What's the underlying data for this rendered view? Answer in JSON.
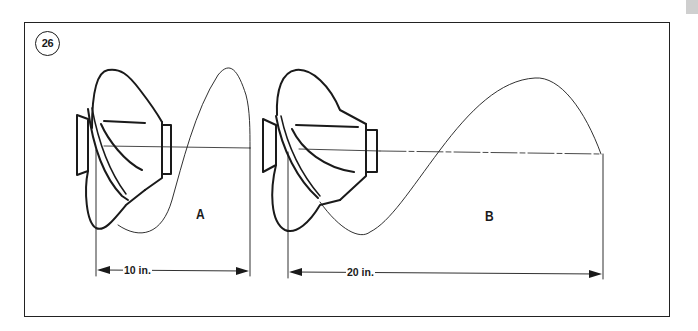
{
  "figure": {
    "number": "26",
    "border_color": "#222222",
    "line_color": "#1a1a1a"
  },
  "diagrams": [
    {
      "label": "A",
      "pitch_label": "10 in.",
      "description": "propeller-with-helix-low-pitch"
    },
    {
      "label": "B",
      "pitch_label": "20 in.",
      "description": "propeller-with-helix-high-pitch"
    }
  ],
  "icons": {
    "figure_number_badge": "circle-badge",
    "dimension_arrow": "double-arrow"
  }
}
